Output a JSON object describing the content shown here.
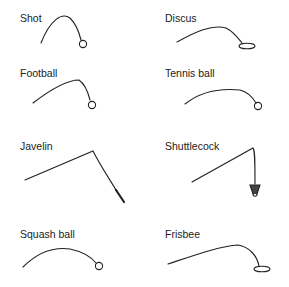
{
  "items": [
    {
      "name": "Shot",
      "x": 20,
      "y": 12
    },
    {
      "name": "Discus",
      "x": 165,
      "y": 12
    },
    {
      "name": "Football",
      "x": 20,
      "y": 67
    },
    {
      "name": "Tennis ball",
      "x": 165,
      "y": 67
    },
    {
      "name": "Javelin",
      "x": 20,
      "y": 140
    },
    {
      "name": "Shuttlecock",
      "x": 165,
      "y": 140
    },
    {
      "name": "Squash ball",
      "x": 20,
      "y": 228
    },
    {
      "name": "Frisbee",
      "x": 165,
      "y": 228
    }
  ],
  "colors": {
    "line": "#222222",
    "background": "#ffffff"
  }
}
